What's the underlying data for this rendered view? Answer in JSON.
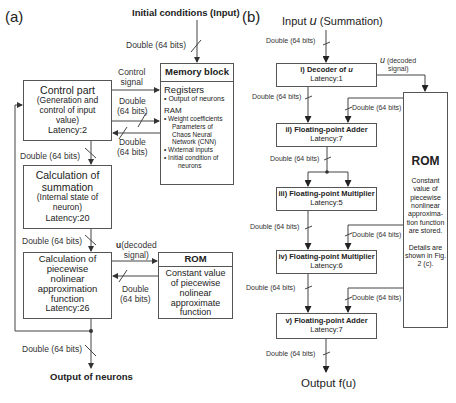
{
  "panel_a": {
    "label": "(a)",
    "input_title": "Initial conditions (Input)",
    "output_title": "Output of neurons",
    "wire_double": "Double (64 bits)",
    "control_signal": [
      "Control",
      "signal"
    ],
    "double_split": [
      "Double",
      "(64 bits)"
    ],
    "u_decoded": [
      "u",
      "(decoded",
      "signal)"
    ],
    "control_box": {
      "title": "Control part",
      "lines": [
        "(Generation and",
        "control of input",
        "value)"
      ],
      "latency": "Latency:2"
    },
    "summation_box": {
      "title": [
        "Calculation of",
        "summation"
      ],
      "lines": [
        "(Internal state of",
        "neuron)"
      ],
      "latency": "Latency:20"
    },
    "piecewise_box": {
      "title": [
        "Calculation of",
        "piecewise",
        "nolinear",
        "approximation",
        "function"
      ],
      "latency": "Latency:26"
    },
    "memory_block": {
      "title": "Memory block",
      "registers_label": "Registers",
      "registers_items": [
        "Output of neurons"
      ],
      "ram_label": "RAM",
      "ram_items": [
        [
          "Weight coefficients",
          "Parameters of",
          "Chaos Neural",
          "Network (CNN)"
        ],
        [
          "Wxternal inputs"
        ],
        [
          "Initial condition of",
          "neurons"
        ]
      ]
    },
    "rom": {
      "title": "ROM",
      "lines": [
        "Constant value",
        "of piecewise",
        "nolinear",
        "approximate",
        "function"
      ]
    }
  },
  "panel_b": {
    "label": "(b)",
    "input_title_prefix": "Input ",
    "input_var": "u",
    "input_title_suffix": " (Summation)",
    "output_title": "Output f(u)",
    "wire_double": "Double (64 bits)",
    "u_decoded": [
      "u",
      " (decoded",
      "signal)"
    ],
    "stages": [
      {
        "title": "i) Decoder of ",
        "var": "u",
        "latency": "Latency:1"
      },
      {
        "title": "ii) Floating-point Adder",
        "latency": "Latency:7"
      },
      {
        "title": "iii) Floating-point Multiplier",
        "latency": "Latency:5"
      },
      {
        "title": "iv) Floating-point Multiplier",
        "latency": "Latency:6"
      },
      {
        "title": "v) Floating-point Adder",
        "latency": "Latency:7"
      }
    ],
    "rom": {
      "title": "ROM",
      "lines": [
        "Constant",
        "value of",
        "piecewise",
        "nonlinear",
        "approxima-",
        "tion function",
        "are stored."
      ],
      "details": [
        "Details are",
        "shown in Fig.",
        "2 (c)."
      ]
    }
  }
}
